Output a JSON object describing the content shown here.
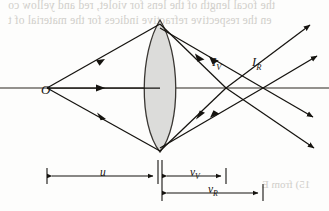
{
  "figure": {
    "kind": "optics-ray-diagram",
    "background_color": "#fdfdfc",
    "ink_color": "#15130f",
    "lens_fill_color": "#dcdcda",
    "lens_stroke_color": "#3a3733",
    "axis_color": "#6f6d68",
    "bleed_text_color": "#c9c7c2"
  },
  "labels": {
    "object": "O",
    "image_violet": "I",
    "image_violet_sub": "V",
    "image_red": "I",
    "image_red_sub": "R",
    "object_distance": "u",
    "image_distance_violet": "v",
    "image_distance_violet_sub": "V",
    "image_distance_red": "v",
    "image_distance_red_sub": "R"
  },
  "bleed_through_text": {
    "line1": "the focal length of the lens for violet, red and yellow co",
    "line2": "en the respective refractive indices for the material of t",
    "line3": "15) from E"
  },
  "geometry": {
    "optical_axis_y": 88,
    "lens_center_x": 160,
    "lens_top_y": 20,
    "lens_bottom_y": 152,
    "lens_half_width": 23,
    "object_x": 47,
    "image_violet_x": 226,
    "image_red_x": 263,
    "dimension_u": {
      "from_x": 47,
      "to_x": 158,
      "y": 176
    },
    "dimension_v_violet": {
      "from_x": 161,
      "to_x": 226,
      "y": 176
    },
    "dimension_v_red": {
      "from_x": 161,
      "to_x": 263,
      "y": 193
    }
  },
  "rays": {
    "count_from_object": 3,
    "upper_ray_lens_y": 30,
    "lower_ray_lens_y": 146,
    "description": "Three rays leave O, refract at the lens; violet rays cross the axis at I_V, red rays cross farther out at I_R, both continuing past their foci."
  }
}
